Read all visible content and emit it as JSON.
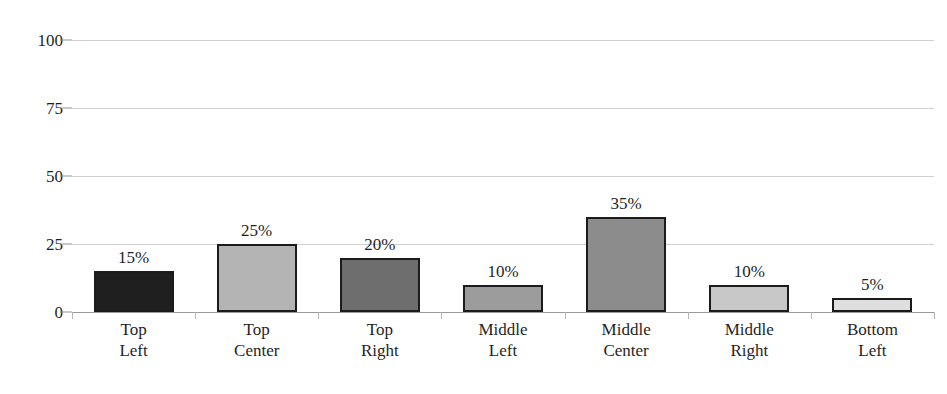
{
  "chart_data": {
    "type": "bar",
    "title": "",
    "subtitle": "",
    "xlabel": "",
    "ylabel": "",
    "ylim": [
      0,
      100
    ],
    "yticks": [
      0,
      25,
      50,
      75,
      100
    ],
    "ytick_labels": [
      "0",
      "25",
      "50",
      "75",
      "100"
    ],
    "grid": true,
    "legend": false,
    "legend_position": "none",
    "categories": [
      "Top\nLeft",
      "Top\nCenter",
      "Top\nRight",
      "Middle\nLeft",
      "Middle\nCenter",
      "Middle\nRight",
      "Bottom\nLeft"
    ],
    "values": [
      15,
      25,
      20,
      10,
      35,
      10,
      5
    ],
    "data_labels": [
      "15%",
      "25%",
      "20%",
      "10%",
      "35%",
      "10%",
      "5%"
    ],
    "bar_colors": [
      "#1f1f1f",
      "#b4b4b4",
      "#6e6e6e",
      "#9c9c9c",
      "#8c8c8c",
      "#c8c8c8",
      "#dedede"
    ],
    "bar_border_color": "#1b1b1b",
    "gridline_color": "#cfcfcf",
    "axis_color": "#9a9a9a",
    "background_color": "#ffffff",
    "text_color": "#1f1f1f"
  }
}
